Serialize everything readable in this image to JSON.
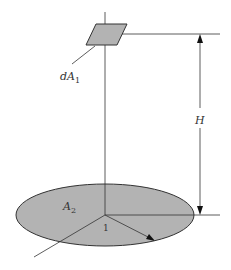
{
  "diagram": {
    "type": "view-factor geometry",
    "labels": {
      "dA1": "dA",
      "dA1_sub": "1",
      "A2": "A",
      "A2_sub": "2",
      "H": "H",
      "radius": "1"
    },
    "colors": {
      "fill": "#b3b3b3",
      "stroke": "#333333",
      "background": "#ffffff"
    },
    "geometry": {
      "element_dA1": {
        "center": [
          106,
          34
        ],
        "shape": "parallelogram"
      },
      "disk_A2": {
        "center": [
          105,
          215
        ],
        "rx": 89,
        "ry": 31
      },
      "height_dimension": {
        "x": 200,
        "y_top": 34,
        "y_bottom": 215
      }
    }
  }
}
